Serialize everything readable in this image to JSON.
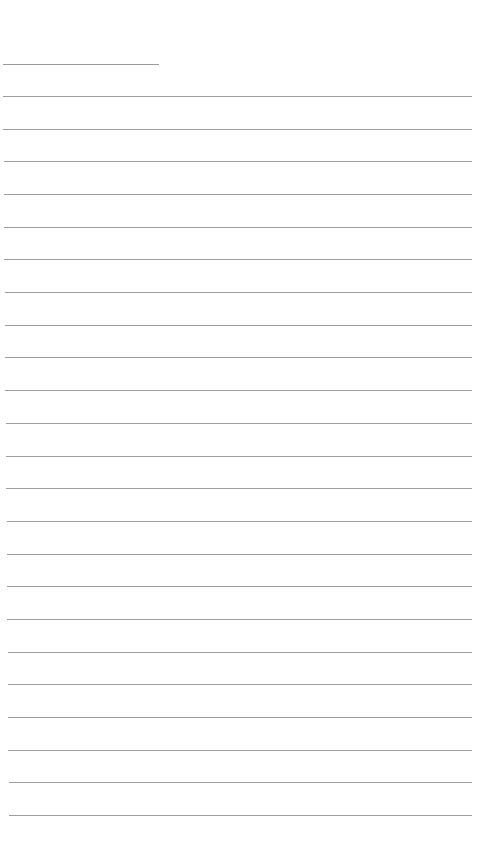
{
  "page": {
    "type": "blank-lined-sheet",
    "background_color": "#ffffff",
    "line_color": "#8c8c8c"
  },
  "header_line": {
    "x_start": 3,
    "x_end": 159,
    "y": 64
  },
  "ruled_lines": {
    "count": 23,
    "first_y": 96,
    "last_y": 815,
    "x_start_top": 3,
    "x_start_bottom": 9,
    "x_end": 472
  }
}
